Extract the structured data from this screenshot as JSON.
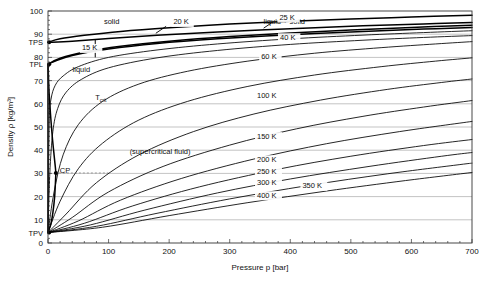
{
  "chart_data": {
    "type": "line",
    "title": "",
    "xlabel": "Pressure p [bar]",
    "ylabel": "Density ρ [kg/m³]",
    "xlim": [
      0,
      700
    ],
    "ylim": [
      0,
      100
    ],
    "grid": true,
    "legend_position": "inline-annotations",
    "x_ticks": [
      0,
      100,
      200,
      300,
      400,
      500,
      600,
      700
    ],
    "x_tick_labels": [
      "0",
      "100",
      "200",
      "300",
      "400",
      "500",
      "600",
      "700"
    ],
    "x_minor_step": 20,
    "y_ticks": [
      0,
      10,
      20,
      30,
      40,
      50,
      60,
      70,
      80,
      90,
      100
    ],
    "y_tick_labels": [
      "0",
      "10",
      "20",
      "30",
      "40",
      "50",
      "60",
      "70",
      "80",
      "90",
      "100"
    ],
    "y_minor_step": 2,
    "special_y_labels": [
      {
        "label": "TPS",
        "value": 86.5
      },
      {
        "label": "TPL",
        "value": 77.0
      },
      {
        "label": "TPV",
        "value": 4.5
      }
    ],
    "region_labels": [
      {
        "text": "solid",
        "x": 105,
        "y": 94.5
      },
      {
        "text": "liquid + solid",
        "x": 390,
        "y": 94.5
      },
      {
        "text": "liquid",
        "x": 55,
        "y": 73.5
      },
      {
        "text": "(supercritical fluid)",
        "x": 185,
        "y": 38.5
      },
      {
        "text": "CP",
        "x": 28,
        "y": 30.2
      }
    ],
    "axis_point_labels": [
      {
        "text": "T",
        "sub": "crit",
        "x": 78,
        "y": 61.5
      }
    ],
    "series": [
      {
        "name": "solid boundary (upper)",
        "style": "thick",
        "points": [
          [
            0,
            86.5
          ],
          [
            20,
            88.0
          ],
          [
            60,
            89.5
          ],
          [
            120,
            91.2
          ],
          [
            200,
            92.8
          ],
          [
            300,
            94.4
          ],
          [
            400,
            95.6
          ],
          [
            500,
            96.6
          ],
          [
            600,
            97.4
          ],
          [
            700,
            98.2
          ]
        ]
      },
      {
        "name": "15 K",
        "style": "thick",
        "points": [
          [
            0,
            86.5
          ],
          [
            40,
            87.0
          ],
          [
            100,
            88.2
          ],
          [
            180,
            89.6
          ],
          [
            280,
            91.0
          ],
          [
            400,
            92.4
          ],
          [
            520,
            93.6
          ],
          [
            620,
            94.4
          ],
          [
            700,
            95.0
          ]
        ]
      },
      {
        "name": "20 K",
        "style": "thick",
        "points": [
          [
            0,
            77.0
          ],
          [
            20,
            79.6
          ],
          [
            60,
            82.3
          ],
          [
            120,
            84.8
          ],
          [
            200,
            87.0
          ],
          [
            300,
            89.0
          ],
          [
            400,
            90.5
          ],
          [
            500,
            91.8
          ],
          [
            600,
            92.9
          ],
          [
            700,
            93.9
          ]
        ]
      },
      {
        "name": "25 K",
        "style": "thick",
        "points": [
          [
            0,
            77.0
          ],
          [
            10,
            78.2
          ],
          [
            40,
            80.8
          ],
          [
            100,
            83.6
          ],
          [
            180,
            86.0
          ],
          [
            280,
            88.0
          ],
          [
            400,
            89.8
          ],
          [
            520,
            91.2
          ],
          [
            620,
            92.2
          ],
          [
            700,
            92.9
          ]
        ]
      },
      {
        "name": "30 K",
        "style": "thin",
        "points": [
          [
            0,
            4.5
          ],
          [
            2,
            52.0
          ],
          [
            5,
            62.0
          ],
          [
            12,
            68.0
          ],
          [
            25,
            72.0
          ],
          [
            50,
            76.0
          ],
          [
            100,
            80.0
          ],
          [
            180,
            83.2
          ],
          [
            280,
            85.8
          ],
          [
            400,
            88.0
          ],
          [
            520,
            89.6
          ],
          [
            620,
            90.7
          ],
          [
            700,
            91.5
          ]
        ]
      },
      {
        "name": "Tcrit (33 K)",
        "style": "thin",
        "points": [
          [
            0,
            4.5
          ],
          [
            3,
            30.0
          ],
          [
            8,
            48.0
          ],
          [
            16,
            58.0
          ],
          [
            30,
            65.0
          ],
          [
            55,
            70.5
          ],
          [
            100,
            75.5
          ],
          [
            180,
            79.8
          ],
          [
            280,
            83.0
          ],
          [
            400,
            85.6
          ],
          [
            520,
            87.4
          ],
          [
            620,
            88.6
          ],
          [
            700,
            89.4
          ]
        ]
      },
      {
        "name": "40 K",
        "style": "thin",
        "points": [
          [
            0,
            4.5
          ],
          [
            10,
            22.0
          ],
          [
            25,
            38.0
          ],
          [
            50,
            51.0
          ],
          [
            90,
            61.0
          ],
          [
            150,
            68.5
          ],
          [
            230,
            74.0
          ],
          [
            330,
            78.4
          ],
          [
            440,
            81.8
          ],
          [
            550,
            84.2
          ],
          [
            640,
            85.8
          ],
          [
            700,
            86.8
          ]
        ]
      },
      {
        "name": "60 K",
        "style": "thin",
        "points": [
          [
            0,
            4.5
          ],
          [
            20,
            18.0
          ],
          [
            50,
            32.0
          ],
          [
            90,
            43.0
          ],
          [
            150,
            53.0
          ],
          [
            230,
            61.0
          ],
          [
            330,
            67.5
          ],
          [
            440,
            72.4
          ],
          [
            550,
            76.0
          ],
          [
            640,
            78.4
          ],
          [
            700,
            79.8
          ]
        ]
      },
      {
        "name": "100 K",
        "style": "thin",
        "points": [
          [
            0,
            4.5
          ],
          [
            30,
            12.5
          ],
          [
            80,
            26.0
          ],
          [
            150,
            38.0
          ],
          [
            240,
            48.0
          ],
          [
            340,
            55.6
          ],
          [
            450,
            61.6
          ],
          [
            560,
            66.2
          ],
          [
            650,
            69.2
          ],
          [
            700,
            70.7
          ]
        ]
      },
      {
        "name": "150 K",
        "style": "thin",
        "points": [
          [
            0,
            4.5
          ],
          [
            40,
            11.0
          ],
          [
            100,
            22.0
          ],
          [
            190,
            33.0
          ],
          [
            300,
            42.2
          ],
          [
            410,
            49.2
          ],
          [
            520,
            54.6
          ],
          [
            620,
            58.6
          ],
          [
            700,
            61.4
          ]
        ]
      },
      {
        "name": "200 K",
        "style": "thin",
        "points": [
          [
            0,
            4.5
          ],
          [
            50,
            9.5
          ],
          [
            120,
            18.5
          ],
          [
            220,
            27.8
          ],
          [
            340,
            36.2
          ],
          [
            460,
            42.8
          ],
          [
            580,
            48.0
          ],
          [
            700,
            52.4
          ]
        ]
      },
      {
        "name": "250 K",
        "style": "thin",
        "points": [
          [
            0,
            4.5
          ],
          [
            60,
            8.5
          ],
          [
            140,
            16.0
          ],
          [
            250,
            24.2
          ],
          [
            380,
            31.8
          ],
          [
            500,
            37.4
          ],
          [
            620,
            42.0
          ],
          [
            700,
            44.6
          ]
        ]
      },
      {
        "name": "300 K",
        "style": "thin",
        "points": [
          [
            0,
            4.5
          ],
          [
            70,
            7.8
          ],
          [
            160,
            14.2
          ],
          [
            280,
            21.6
          ],
          [
            400,
            27.6
          ],
          [
            530,
            33.0
          ],
          [
            650,
            37.4
          ],
          [
            700,
            39.0
          ]
        ]
      },
      {
        "name": "350 K",
        "style": "thin",
        "points": [
          [
            0,
            4.5
          ],
          [
            80,
            7.2
          ],
          [
            180,
            12.8
          ],
          [
            300,
            19.0
          ],
          [
            430,
            24.8
          ],
          [
            560,
            29.8
          ],
          [
            680,
            33.8
          ],
          [
            700,
            34.4
          ]
        ]
      },
      {
        "name": "400 K",
        "style": "thin",
        "points": [
          [
            0,
            4.5
          ],
          [
            90,
            6.8
          ],
          [
            200,
            11.8
          ],
          [
            330,
            17.4
          ],
          [
            460,
            22.4
          ],
          [
            590,
            26.9
          ],
          [
            700,
            30.4
          ]
        ]
      },
      {
        "name": "saturation-left",
        "style": "thick",
        "points": [
          [
            0,
            77.0
          ],
          [
            0.5,
            74.0
          ],
          [
            1,
            70.0
          ],
          [
            2,
            64.0
          ],
          [
            4,
            56.0
          ],
          [
            7,
            46.0
          ],
          [
            10,
            38.0
          ],
          [
            12,
            33.0
          ],
          [
            13,
            30.2
          ]
        ]
      },
      {
        "name": "saturation-right",
        "style": "thick",
        "points": [
          [
            13,
            30.2
          ],
          [
            11,
            20.0
          ],
          [
            8,
            13.0
          ],
          [
            5,
            8.5
          ],
          [
            2,
            6.0
          ],
          [
            0,
            4.5
          ]
        ]
      },
      {
        "name": "vapor-axis",
        "style": "thick",
        "points": [
          [
            0,
            77.0
          ],
          [
            0,
            4.5
          ]
        ]
      }
    ],
    "isotherm_labels": [
      {
        "text": "15 K",
        "x": 56,
        "y": 83.0
      },
      {
        "text": "20 K",
        "x": 207,
        "y": 94.2
      },
      {
        "text": "25 K",
        "x": 382,
        "y": 96.2
      },
      {
        "text": "40 K",
        "x": 383,
        "y": 87.6
      },
      {
        "text": "60 K",
        "x": 352,
        "y": 79.5
      },
      {
        "text": "100 K",
        "x": 345,
        "y": 62.5
      },
      {
        "text": "150 K",
        "x": 345,
        "y": 45.0
      },
      {
        "text": "200 K",
        "x": 345,
        "y": 35.0
      },
      {
        "text": "250 K",
        "x": 345,
        "y": 29.8
      },
      {
        "text": "300 K",
        "x": 345,
        "y": 24.8
      },
      {
        "text": "350 K",
        "x": 420,
        "y": 23.6
      },
      {
        "text": "400 K",
        "x": 345,
        "y": 19.5
      }
    ]
  }
}
